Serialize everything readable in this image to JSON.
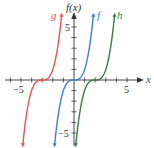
{
  "chart_data": {
    "type": "line",
    "title": "",
    "xlabel": "x",
    "ylabel": "f(x)",
    "xlim": [
      -6.5,
      7
    ],
    "ylim": [
      -6.2,
      6.2
    ],
    "grid": false,
    "x_ticks": [
      -6,
      -5,
      -4,
      -3,
      -2,
      -1,
      1,
      2,
      3,
      4,
      5,
      6
    ],
    "y_ticks": [
      -5,
      -4,
      -3,
      -2,
      -1,
      1,
      2,
      3,
      4,
      5
    ],
    "x_tick_labels": [
      {
        "value": -5,
        "label": "−5"
      },
      {
        "value": 5,
        "label": "5"
      }
    ],
    "y_tick_labels": [
      {
        "value": 5,
        "label": "5"
      },
      {
        "value": -5,
        "label": "−5"
      }
    ],
    "series": [
      {
        "name": "g",
        "expression": "(x+3)^3",
        "shift": -3,
        "color": "#e8535a"
      },
      {
        "name": "f",
        "expression": "x^3",
        "shift": 0,
        "color": "#3b7fd9"
      },
      {
        "name": "h",
        "expression": "(x-2)^3",
        "shift": 2,
        "color": "#3d7a43"
      }
    ],
    "legend_position": "curve-end labels at top"
  },
  "labels": {
    "y_axis": "f(x)",
    "x_axis": "x",
    "x_neg5": "−5",
    "x_pos5": "5",
    "y_pos5": "5",
    "y_neg5": "−5",
    "g": "g",
    "f": "f",
    "h": "h"
  }
}
